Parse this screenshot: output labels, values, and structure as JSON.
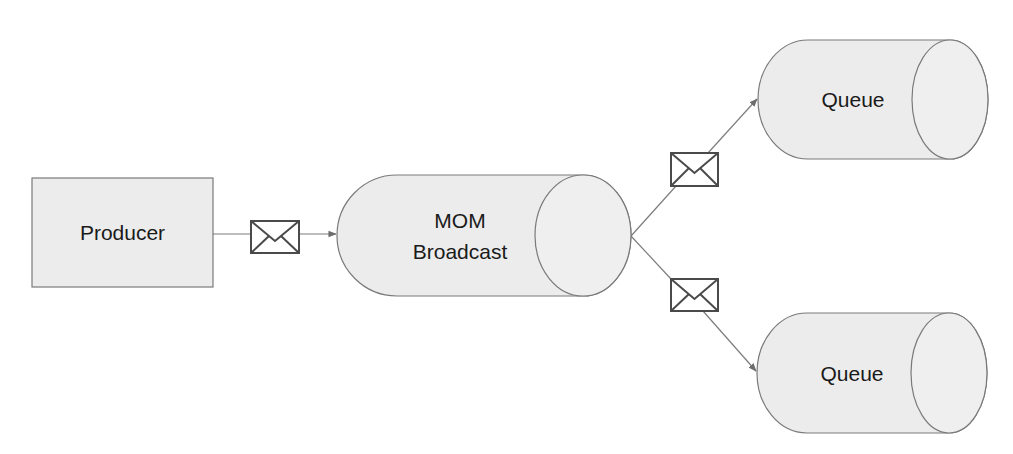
{
  "diagram": {
    "title": "",
    "nodes": {
      "producer": {
        "label": "Producer",
        "shape": "rectangle"
      },
      "broadcast": {
        "label_lines": [
          "MOM",
          "Broadcast"
        ],
        "shape": "cylinder"
      },
      "queue_top": {
        "label": "Queue",
        "shape": "cylinder"
      },
      "queue_bottom": {
        "label": "Queue",
        "shape": "cylinder"
      }
    },
    "edges": [
      {
        "from": "producer",
        "to": "broadcast",
        "icon": "envelope-icon"
      },
      {
        "from": "broadcast",
        "to": "queue_top",
        "icon": "envelope-icon"
      },
      {
        "from": "broadcast",
        "to": "queue_bottom",
        "icon": "envelope-icon"
      }
    ],
    "colors": {
      "shape_fill": "#ececec",
      "stroke": "#7a7a7a",
      "envelope_stroke": "#4a4a4a",
      "text": "#1a1a1a"
    }
  }
}
